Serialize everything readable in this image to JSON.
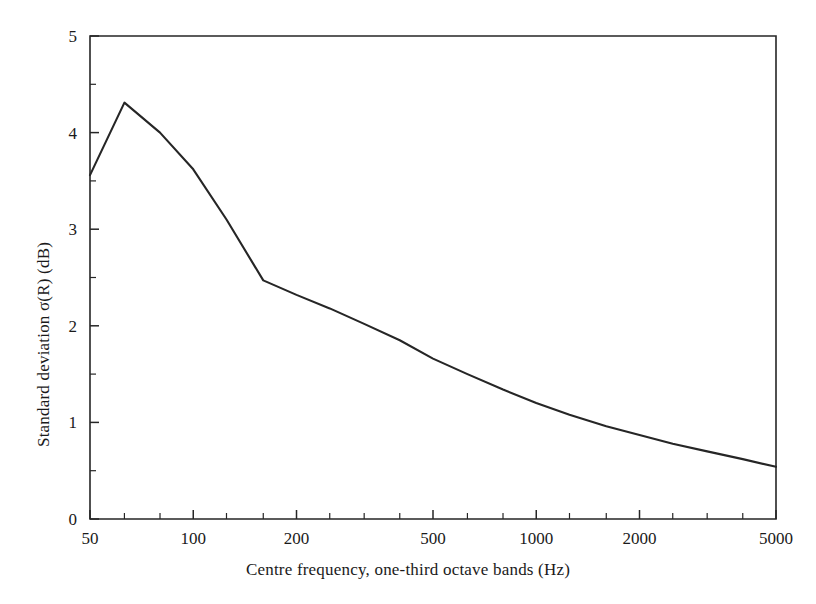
{
  "chart_data": {
    "type": "line",
    "title": "",
    "xlabel": "Centre frequency, one-third octave bands (Hz)",
    "ylabel": "Standard deviation σ(R) (dB)",
    "xscale": "log",
    "xlim": [
      50,
      5000
    ],
    "ylim": [
      0,
      5
    ],
    "grid": false,
    "legend": null,
    "x_tick_labels": [
      "50",
      "100",
      "200",
      "500",
      "1000",
      "2000",
      "5000"
    ],
    "x_tick_values": [
      50,
      100,
      200,
      500,
      1000,
      2000,
      5000
    ],
    "x_minor_tick_values": [
      63,
      80,
      125,
      160,
      250,
      315,
      400,
      630,
      800,
      1250,
      1600,
      2500,
      3150,
      4000
    ],
    "y_tick_labels": [
      "0",
      "1",
      "2",
      "3",
      "4",
      "5"
    ],
    "y_tick_values": [
      0,
      1,
      2,
      3,
      4,
      5
    ],
    "y_minor_tick_values": [
      0.5,
      1.5,
      2.5,
      3.5,
      4.5
    ],
    "series": [
      {
        "name": "Standard deviation of sound reduction index",
        "color": "#262626",
        "x": [
          50,
          63,
          80,
          100,
          125,
          160,
          200,
          250,
          315,
          400,
          500,
          630,
          800,
          1000,
          1250,
          1600,
          2000,
          2500,
          3150,
          4000,
          5000
        ],
        "y": [
          3.56,
          4.31,
          4.0,
          3.62,
          3.1,
          2.47,
          2.32,
          2.18,
          2.02,
          1.85,
          1.66,
          1.5,
          1.34,
          1.2,
          1.08,
          0.96,
          0.87,
          0.78,
          0.7,
          0.62,
          0.54
        ]
      }
    ]
  },
  "axis_titles": {
    "x": "Centre frequency, one-third octave bands (Hz)",
    "y": "Standard deviation σ(R) (dB)"
  }
}
